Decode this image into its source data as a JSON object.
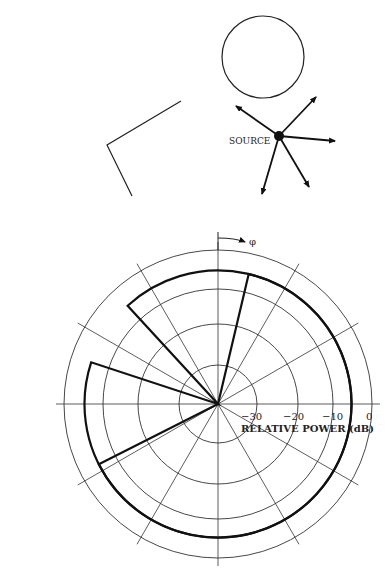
{
  "top_figure": {
    "source_label": "SOURCE",
    "circle": {
      "cx": 263,
      "cy": 57,
      "r": 41
    },
    "source_point": {
      "x": 279,
      "y": 136
    },
    "arrows": [
      {
        "x": 236,
        "y": 106
      },
      {
        "x": 316,
        "y": 97
      },
      {
        "x": 335,
        "y": 141
      },
      {
        "x": 309,
        "y": 187
      },
      {
        "x": 262,
        "y": 194
      }
    ],
    "reflector_polyline": "181,101 107,145 132,196"
  },
  "polar_plot": {
    "angle_label": "φ",
    "axis_title": "RELATIVE POWER (dB)",
    "ring_labels": [
      "−30",
      "−20",
      "−10",
      "0"
    ]
  },
  "chart_data": {
    "type": "polar",
    "title": "",
    "radial_axis": {
      "label": "RELATIVE POWER (dB)",
      "ticks": [
        -30,
        -20,
        -10,
        0
      ],
      "range": [
        -40,
        0
      ]
    },
    "angular_axis": {
      "label": "φ",
      "spokes_deg": [
        0,
        30,
        60,
        90,
        120,
        150,
        180,
        210,
        240,
        270,
        300,
        330
      ],
      "direction": "clockwise from vertical"
    },
    "grid": true,
    "series": [
      {
        "name": "main lobe",
        "level_db": -5,
        "from_deg": 76.7,
        "to_deg": -153.2,
        "note": "sector through right side and bottom"
      },
      {
        "name": "side lobe",
        "level_db": -5,
        "from_deg": 132.6,
        "to_deg": 161.8,
        "note": "upper-left sector"
      }
    ]
  }
}
